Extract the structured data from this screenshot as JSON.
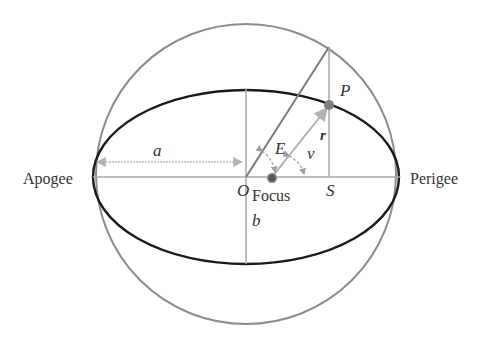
{
  "diagram": {
    "labels": {
      "apogee": "Apogee",
      "perigee": "Perigee",
      "semi_major": "a",
      "semi_minor": "b",
      "center": "O",
      "focus": "Focus",
      "point": "P",
      "foot": "S",
      "eccentric_anomaly": "E",
      "true_anomaly": "ν",
      "radius": "r"
    },
    "colors": {
      "ellipse": "#1a1a1a",
      "circle": "#8c8c8c",
      "construction": "#a6a6a6",
      "arrows": "#b0b0b0",
      "text": "#333333",
      "point": "#808080"
    },
    "geometry": {
      "center": [
        246,
        177
      ],
      "semi_major_px": 153,
      "semi_minor_px": 87,
      "circle_radius_px": 150,
      "focus": [
        272,
        177
      ],
      "point_P": [
        329,
        105
      ],
      "circle_point": [
        329,
        47
      ],
      "foot_S": [
        329,
        177
      ]
    }
  }
}
